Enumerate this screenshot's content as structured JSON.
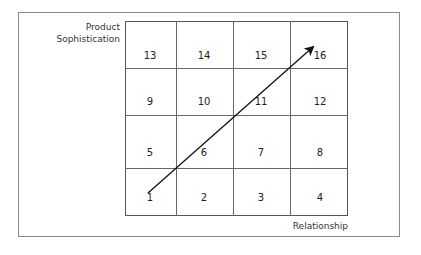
{
  "diagram": {
    "y_axis_label_line1": "Product",
    "y_axis_label_line2": "Sophistication",
    "x_axis_label": "Relationship",
    "grid": {
      "rows": 4,
      "columns": 4,
      "cells": [
        {
          "label": "13",
          "row": 0,
          "col": 0
        },
        {
          "label": "14",
          "row": 0,
          "col": 1
        },
        {
          "label": "15",
          "row": 0,
          "col": 2
        },
        {
          "label": "16",
          "row": 0,
          "col": 3
        },
        {
          "label": "9",
          "row": 1,
          "col": 0
        },
        {
          "label": "10",
          "row": 1,
          "col": 1
        },
        {
          "label": "11",
          "row": 1,
          "col": 2
        },
        {
          "label": "12",
          "row": 1,
          "col": 3
        },
        {
          "label": "5",
          "row": 2,
          "col": 0
        },
        {
          "label": "6",
          "row": 2,
          "col": 1
        },
        {
          "label": "7",
          "row": 2,
          "col": 2
        },
        {
          "label": "8",
          "row": 2,
          "col": 3
        },
        {
          "label": "1",
          "row": 3,
          "col": 0
        },
        {
          "label": "2",
          "row": 3,
          "col": 1
        },
        {
          "label": "3",
          "row": 3,
          "col": 2
        },
        {
          "label": "4",
          "row": 3,
          "col": 3
        }
      ]
    },
    "arrow": {
      "from_cell": "1",
      "to_cell": "16",
      "direction": "diagonal-up-right"
    },
    "colors": {
      "line": "#555555",
      "arrow": "#111111",
      "text": "#222222"
    }
  }
}
